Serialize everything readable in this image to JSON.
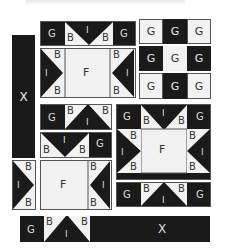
{
  "diagram": {
    "legend_letters": [
      "X",
      "G",
      "B",
      "I",
      "F"
    ],
    "colors": {
      "dark": "#1a1a1a",
      "light": "#f2f2f2",
      "border": "#555555"
    },
    "pieces": {
      "x_column": {
        "label": "X"
      },
      "top_row": {
        "g_left": "G",
        "b_left": "B",
        "i": "I",
        "b_right": "B",
        "g_right": "G"
      },
      "top_f_block": {
        "center": "F",
        "b_tl": "B",
        "i_left": "I",
        "b_bl": "B",
        "b_tr": "B",
        "i_right": "I",
        "b_br": "B"
      },
      "ggg_grid": {
        "rows": [
          [
            "G",
            "G",
            "G"
          ],
          [
            "G",
            "G",
            "G"
          ],
          [
            "G",
            "G",
            "G"
          ]
        ]
      },
      "mid_row1": {
        "g": "G",
        "b_left": "B",
        "i": "I",
        "b_right": "B"
      },
      "mid_row2": {
        "b_left": "B",
        "i": "I",
        "b_right": "B",
        "g": "G"
      },
      "small_side": {
        "b_top": "B",
        "i": "I",
        "b_bottom": "B"
      },
      "bottom_f_block": {
        "center": "F",
        "b_top": "B",
        "i": "I",
        "b_bottom": "B"
      },
      "big_star": {
        "top": {
          "g_left": "G",
          "b_left": "B",
          "i": "I",
          "b_right": "B",
          "g_right": "G"
        },
        "left": {
          "b_top": "B",
          "i": "I",
          "b_bottom": "B"
        },
        "center": "F",
        "right": {
          "b_top": "B",
          "i": "I",
          "b_bottom": "B"
        },
        "bottom": {
          "g_left": "G",
          "b_left": "B",
          "i": "I",
          "b_right": "B",
          "g_right": "G"
        }
      },
      "bottom_bar": {
        "g": "G",
        "b_left": "B",
        "i": "I",
        "b_right": "B",
        "x": "X"
      }
    }
  }
}
